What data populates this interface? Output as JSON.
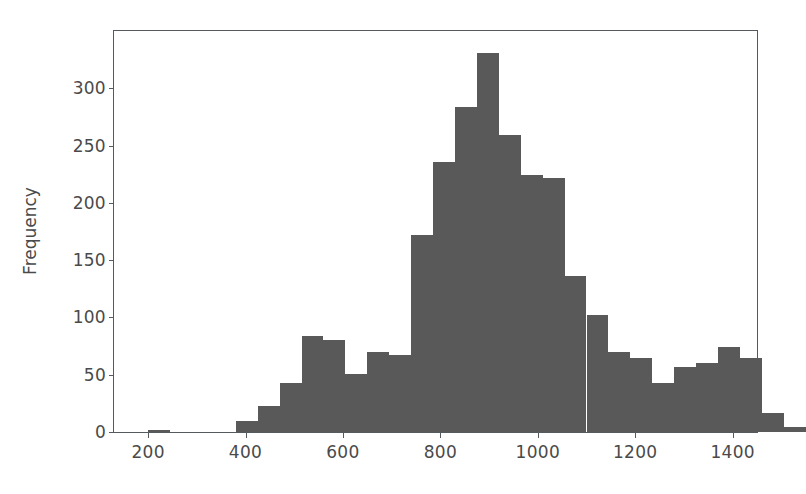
{
  "chart_data": {
    "type": "bar",
    "title": "",
    "xlabel": "",
    "ylabel": "Frequency",
    "xlim": [
      130,
      1450
    ],
    "ylim": [
      0,
      350
    ],
    "grid": false,
    "legend": null,
    "bar_color": "#595959",
    "axis_color": "#555a5e",
    "background": "#ffffff",
    "bin_width": 45,
    "xticks": [
      200,
      400,
      600,
      800,
      1000,
      1200,
      1400
    ],
    "xtick_labels": [
      "200",
      "400",
      "600",
      "800",
      "1000",
      "1200",
      "1400"
    ],
    "yticks": [
      0,
      50,
      100,
      150,
      200,
      250,
      300
    ],
    "ytick_labels": [
      "0",
      "50",
      "100",
      "150",
      "200",
      "250",
      "300"
    ],
    "bins": [
      {
        "left": 200,
        "right": 245,
        "value": 2
      },
      {
        "left": 245,
        "right": 290,
        "value": 0
      },
      {
        "left": 290,
        "right": 335,
        "value": 0
      },
      {
        "left": 335,
        "right": 380,
        "value": 0
      },
      {
        "left": 380,
        "right": 425,
        "value": 10
      },
      {
        "left": 425,
        "right": 470,
        "value": 23
      },
      {
        "left": 470,
        "right": 515,
        "value": 43
      },
      {
        "left": 515,
        "right": 560,
        "value": 84
      },
      {
        "left": 560,
        "right": 605,
        "value": 80
      },
      {
        "left": 605,
        "right": 650,
        "value": 51
      },
      {
        "left": 650,
        "right": 695,
        "value": 70
      },
      {
        "left": 695,
        "right": 740,
        "value": 67
      },
      {
        "left": 740,
        "right": 785,
        "value": 172
      },
      {
        "left": 785,
        "right": 830,
        "value": 236
      },
      {
        "left": 830,
        "right": 875,
        "value": 284
      },
      {
        "left": 875,
        "right": 920,
        "value": 331
      },
      {
        "left": 920,
        "right": 965,
        "value": 259
      },
      {
        "left": 965,
        "right": 1010,
        "value": 224
      },
      {
        "left": 1010,
        "right": 1055,
        "value": 222
      },
      {
        "left": 1055,
        "right": 1100,
        "value": 136
      },
      {
        "left": 1100,
        "right": 1145,
        "value": 102
      },
      {
        "left": 1145,
        "right": 1190,
        "value": 70
      },
      {
        "left": 1190,
        "right": 1235,
        "value": 65
      },
      {
        "left": 1235,
        "right": 1280,
        "value": 43
      },
      {
        "left": 1280,
        "right": 1325,
        "value": 57
      },
      {
        "left": 1325,
        "right": 1370,
        "value": 60
      },
      {
        "left": 1370,
        "right": 1415,
        "value": 74
      },
      {
        "left": 1415,
        "right": 1460,
        "value": 65
      },
      {
        "left": 1460,
        "right": 1505,
        "value": 17
      },
      {
        "left": 1505,
        "right": 1550,
        "value": 4
      }
    ]
  }
}
